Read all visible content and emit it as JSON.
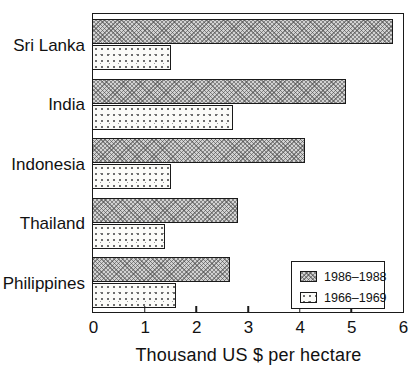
{
  "chart_data": {
    "type": "bar",
    "orientation": "horizontal",
    "title": "",
    "xlabel": "Thousand US $ per hectare",
    "ylabel": "",
    "xlim": [
      0,
      6
    ],
    "xticks": [
      0,
      1,
      2,
      3,
      4,
      5,
      6
    ],
    "grid": false,
    "legend_position": "bottom-right-inside",
    "categories": [
      "Sri Lanka",
      "India",
      "Indonesia",
      "Thailand",
      "Philippines"
    ],
    "series": [
      {
        "name": "1986–1988",
        "pattern": "hatched",
        "values": [
          5.8,
          4.9,
          4.1,
          2.8,
          2.65
        ]
      },
      {
        "name": "1966–1969",
        "pattern": "dotted",
        "values": [
          1.5,
          2.7,
          1.5,
          1.4,
          1.6
        ]
      }
    ]
  },
  "colors": {
    "background": "#ffffff",
    "ink": "#1a1a1a",
    "hatched_fill": "#d2d2d2",
    "dotted_fill": "#fbfbf8"
  }
}
